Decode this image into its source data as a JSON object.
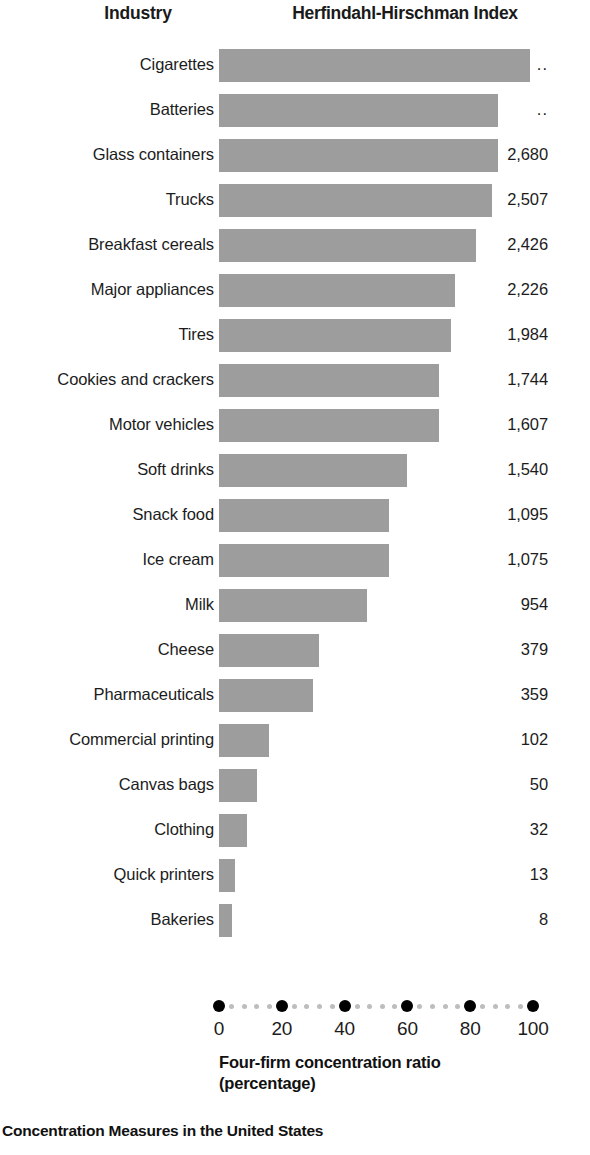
{
  "header": {
    "industry_label": "Industry",
    "hhi_label": "Herfindahl-Hirschman Index"
  },
  "axis": {
    "title_line1": "Four-firm concentration ratio",
    "title_line2": "(percentage)",
    "ticks": [
      "0",
      "20",
      "40",
      "60",
      "80",
      "100"
    ]
  },
  "caption": "Concentration Measures in the United States",
  "chart_data": {
    "type": "bar",
    "orientation": "horizontal",
    "title": "Concentration Measures in the United States",
    "xlabel": "Four-firm concentration ratio (percentage)",
    "ylabel": "Industry",
    "xlim": [
      0,
      100
    ],
    "grid": false,
    "legend": "none",
    "categories": [
      "Cigarettes",
      "Batteries",
      "Glass containers",
      "Trucks",
      "Breakfast cereals",
      "Major appliances",
      "Tires",
      "Cookies and crackers",
      "Motor vehicles",
      "Soft drinks",
      "Snack food",
      "Ice cream",
      "Milk",
      "Cheese",
      "Pharmaceuticals",
      "Commercial printing",
      "Canvas bags",
      "Clothing",
      "Quick printers",
      "Bakeries"
    ],
    "values": [
      99,
      89,
      89,
      87,
      82,
      75,
      74,
      70,
      70,
      60,
      54,
      54,
      47,
      32,
      30,
      16,
      12,
      9,
      5,
      4
    ],
    "value_labels": [
      "..",
      "..",
      "2,680",
      "2,507",
      "2,426",
      "2,226",
      "1,984",
      "1,744",
      "1,607",
      "1,540",
      "1,095",
      "1,075",
      "954",
      "379",
      "359",
      "102",
      "50",
      "32",
      "13",
      "8"
    ],
    "series": [
      {
        "name": "Four-firm concentration ratio",
        "values": [
          99,
          89,
          89,
          87,
          82,
          75,
          74,
          70,
          70,
          60,
          54,
          54,
          47,
          32,
          30,
          16,
          12,
          9,
          5,
          4
        ]
      },
      {
        "name": "Herfindahl-Hirschman Index",
        "values": [
          null,
          null,
          2680,
          2507,
          2426,
          2226,
          1984,
          1744,
          1607,
          1540,
          1095,
          1075,
          954,
          379,
          359,
          102,
          50,
          32,
          13,
          8
        ]
      }
    ]
  },
  "colors": {
    "bar": "#9d9d9d",
    "axis_major_dot": "#000000",
    "axis_minor_dot": "#bdbdbd",
    "text": "#1c1c1c",
    "background": "#ffffff"
  }
}
